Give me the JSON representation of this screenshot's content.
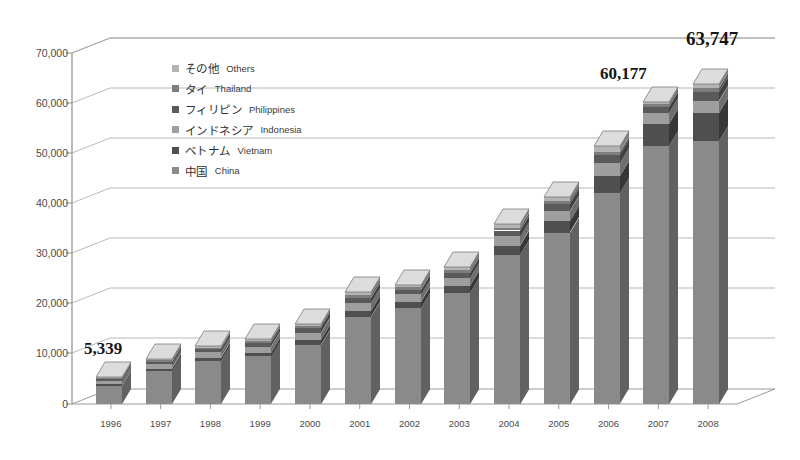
{
  "title_faint": "· ·   ·",
  "legend": {
    "items": [
      {
        "jp": "その他",
        "en": "Others",
        "color": "#b4b4b4"
      },
      {
        "jp": "タイ",
        "en": "Thailand",
        "color": "#7d7d7d"
      },
      {
        "jp": "フィリピン",
        "en": "Philippines",
        "color": "#5a5a5a"
      },
      {
        "jp": "インドネシア",
        "en": "Indonesia",
        "color": "#9e9e9e"
      },
      {
        "jp": "ベトナム",
        "en": "Vietnam",
        "color": "#4f4f4f"
      },
      {
        "jp": "中国",
        "en": "China",
        "color": "#8a8a8a"
      }
    ]
  },
  "chart_data": {
    "type": "bar",
    "subtype": "stacked-column-3d",
    "title": "",
    "xlabel": "",
    "ylabel": "",
    "ylim": [
      0,
      70000
    ],
    "ytick_step": 10000,
    "grid": true,
    "legend_position": "inside-top-left",
    "categories": [
      "1996",
      "1997",
      "1998",
      "1999",
      "2000",
      "2001",
      "2002",
      "2003",
      "2004",
      "2005",
      "2006",
      "2007",
      "2008"
    ],
    "ytick_labels": [
      "0",
      "10,000",
      "20,000",
      "30,000",
      "40,000",
      "50,000",
      "60,000",
      "70,000"
    ],
    "series": [
      {
        "name": "中国 China",
        "color": "#8a8a8a",
        "values": [
          3600,
          6600,
          8600,
          9500,
          11800,
          17400,
          19200,
          22200,
          29800,
          34200,
          42000,
          51500,
          52500
        ]
      },
      {
        "name": "ベトナム Vietnam",
        "color": "#4f4f4f",
        "values": [
          300,
          450,
          600,
          700,
          900,
          1100,
          1200,
          1400,
          1800,
          2200,
          3400,
          4400,
          5600
        ]
      },
      {
        "name": "インドネシア Indonesia",
        "color": "#9e9e9e",
        "values": [
          700,
          900,
          1100,
          1200,
          1500,
          1700,
          1500,
          1600,
          1900,
          2100,
          2600,
          2200,
          2400
        ]
      },
      {
        "name": "フィリピン Philippines",
        "color": "#5a5a5a",
        "values": [
          400,
          500,
          600,
          700,
          900,
          1000,
          900,
          1000,
          1100,
          1300,
          1600,
          1200,
          1700
        ]
      },
      {
        "name": "タイ Thailand",
        "color": "#7d7d7d",
        "values": [
          250,
          300,
          350,
          400,
          450,
          500,
          450,
          500,
          550,
          600,
          700,
          500,
          800
        ]
      },
      {
        "name": "その他 Others",
        "color": "#b4b4b4",
        "values": [
          89,
          250,
          350,
          400,
          450,
          600,
          550,
          700,
          750,
          900,
          1100,
          377,
          747
        ]
      }
    ],
    "totals": [
      5339,
      9000,
      11600,
      12900,
      16000,
      22300,
      23800,
      27400,
      35900,
      41300,
      51400,
      60177,
      63747
    ],
    "annotations": [
      {
        "category": "1996",
        "text": "5,339"
      },
      {
        "category": "2007",
        "text": "60,177"
      },
      {
        "category": "2008",
        "text": "63,747"
      }
    ]
  }
}
